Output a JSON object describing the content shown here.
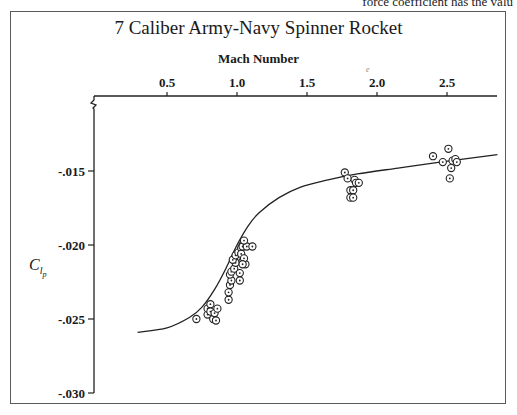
{
  "page": {
    "clipped_text": "force coefficient has the valu"
  },
  "chart_data": {
    "type": "scatter",
    "title": "7 Caliber Army-Navy Spinner Rocket",
    "xlabel": "Mach Number",
    "ylabel": "C_lp",
    "ylabel_parts": {
      "base": "C",
      "sub": "l",
      "subsub": "p"
    },
    "xlim": [
      0.3,
      2.86
    ],
    "ylim": [
      -0.03,
      -0.0125
    ],
    "x_axis_position": "top",
    "x_ticks": [
      0.5,
      1.0,
      1.5,
      2.0,
      2.5
    ],
    "x_tick_labels": [
      "0.5",
      "1.0",
      "1.5",
      "2.0",
      "2.5"
    ],
    "y_ticks": [
      -0.015,
      -0.02,
      -0.025,
      -0.03
    ],
    "y_tick_labels": [
      "-.015",
      "-.020",
      "-.025",
      "-.030"
    ],
    "y_axis_break": true,
    "grid": false,
    "legend": null,
    "annotations": [
      "e"
    ],
    "series": [
      {
        "name": "Fitted curve",
        "style": "line",
        "x": [
          0.29,
          0.5,
          0.66,
          0.75,
          0.84,
          0.92,
          1.0,
          1.08,
          1.16,
          1.3,
          1.45,
          1.65,
          1.86,
          2.15,
          2.45,
          2.86
        ],
        "y": [
          -0.0259,
          -0.0256,
          -0.0249,
          -0.0242,
          -0.023,
          -0.0216,
          -0.02,
          -0.0187,
          -0.0178,
          -0.0168,
          -0.0161,
          -0.0156,
          -0.0152,
          -0.0148,
          -0.0144,
          -0.0139
        ]
      },
      {
        "name": "Measured data",
        "style": "circle-dot markers",
        "x": [
          0.71,
          0.79,
          0.79,
          0.81,
          0.81,
          0.83,
          0.84,
          0.86,
          0.85,
          0.94,
          0.94,
          0.95,
          0.96,
          0.95,
          0.96,
          0.98,
          0.99,
          0.97,
          0.99,
          1.01,
          1.03,
          1.04,
          1.03,
          1.04,
          1.06,
          1.02,
          1.04,
          1.07,
          1.11,
          1.05,
          1.05,
          1.04,
          1.02,
          1.77,
          1.79,
          1.81,
          1.81,
          1.83,
          1.84,
          1.85,
          1.87,
          1.83,
          2.4,
          2.47,
          2.51,
          2.52,
          2.53,
          2.54,
          2.56,
          2.57
        ],
        "y": [
          -0.025,
          -0.0247,
          -0.0243,
          -0.024,
          -0.0245,
          -0.025,
          -0.0246,
          -0.0243,
          -0.0251,
          -0.0237,
          -0.0232,
          -0.0227,
          -0.0224,
          -0.022,
          -0.0218,
          -0.0216,
          -0.0212,
          -0.021,
          -0.0207,
          -0.0205,
          -0.0202,
          -0.02,
          -0.0206,
          -0.0211,
          -0.0213,
          -0.0219,
          -0.0201,
          -0.0201,
          -0.0201,
          -0.0197,
          -0.0209,
          -0.0213,
          -0.0224,
          -0.0151,
          -0.0155,
          -0.0163,
          -0.0168,
          -0.0163,
          -0.0156,
          -0.0158,
          -0.0158,
          -0.0168,
          -0.014,
          -0.0144,
          -0.0135,
          -0.0155,
          -0.0148,
          -0.0143,
          -0.0142,
          -0.0144
        ]
      }
    ]
  }
}
